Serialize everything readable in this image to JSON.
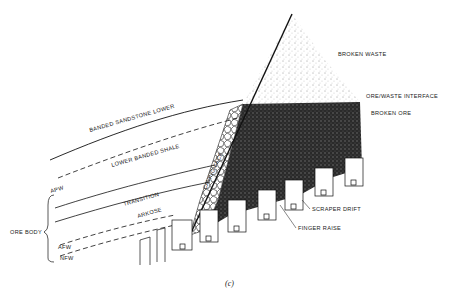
{
  "diagram": {
    "caption": "(c)",
    "labels": {
      "broken_waste": "BROKEN WASTE",
      "ore_waste_interface": "ORE/WASTE INTERFACE",
      "broken_ore": "BROKEN ORE",
      "banded_sandstone_lower": "BANDED SANDSTONE LOWER",
      "lower_banded_shale": "LOWER BANDED SHALE",
      "caving_face": "CAVING FACE",
      "apw": "APW",
      "transition": "TRANSITION",
      "arkose": "ARKOSE",
      "ore_body": "ORE BODY",
      "afw": "AFW",
      "nfw": "NFW",
      "scraper_drift": "SCRAPER DRIFT",
      "finger_raise": "FINGER RAISE"
    },
    "colors": {
      "ink": "#1a1a1a",
      "background": "#ffffff"
    }
  }
}
